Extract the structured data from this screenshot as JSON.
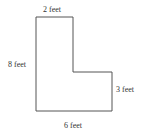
{
  "diagram": {
    "type": "L-shaped polygon",
    "labels": {
      "top": "2 feet",
      "left": "8 feet",
      "right": "3 feet",
      "bottom": "6 feet"
    },
    "stroke_color": "#555555"
  }
}
